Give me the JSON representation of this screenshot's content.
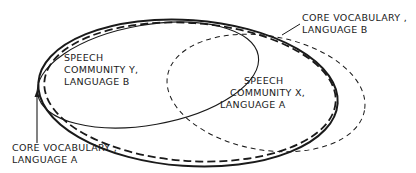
{
  "diagram": {
    "type": "venn-ellipses",
    "labels": {
      "community_y": {
        "line1": "SPEECH",
        "line2": "COMMUNITY Y,",
        "line3": "LANGUAGE B"
      },
      "community_x": {
        "line1": "SPEECH",
        "line2": "COMMUNITY X,",
        "line3": "LANGUAGE A"
      },
      "core_b": {
        "line1": "CORE VOCABULARY ,",
        "line2": "LANGUAGE B"
      },
      "core_a": {
        "line1": "CORE VOCABULARY ,",
        "line2": "LANGUAGE A"
      }
    },
    "shapes": [
      {
        "name": "core-vocabulary-language-b",
        "style": "solid-thick"
      },
      {
        "name": "core-vocabulary-language-a",
        "style": "dashed-thick"
      },
      {
        "name": "speech-community-y",
        "style": "solid-thin"
      },
      {
        "name": "speech-community-x",
        "style": "dashed-thin"
      }
    ],
    "colors": {
      "ink": "#1a1a1a",
      "background": "#ffffff"
    }
  }
}
